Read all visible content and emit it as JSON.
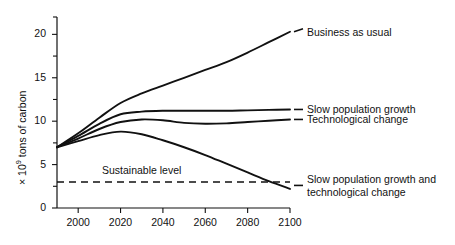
{
  "chart_data": {
    "type": "line",
    "title": "",
    "xlabel": "",
    "ylabel_prefix": "× 10",
    "ylabel_exponent": "9",
    "ylabel_suffix": " tons of carbon",
    "ylabel_full": "× 10⁹ tons of carbon",
    "xlim": [
      1990,
      2100
    ],
    "ylim": [
      0,
      22
    ],
    "grid": false,
    "legend_position": "right-inline-labels",
    "xticks": [
      2000,
      2020,
      2040,
      2060,
      2080,
      2100
    ],
    "xtick_labels": [
      "2000",
      "2020",
      "2040",
      "2060",
      "2080",
      "2100"
    ],
    "yticks": [
      0,
      5,
      10,
      15,
      20
    ],
    "ytick_labels": [
      "0",
      "5",
      "10",
      "15",
      "20"
    ],
    "yminor_ticks": [
      2.5,
      7.5,
      12.5,
      17.5,
      22
    ],
    "x": [
      1990,
      2000,
      2010,
      2020,
      2030,
      2040,
      2050,
      2060,
      2070,
      2080,
      2090,
      2100
    ],
    "series": [
      {
        "name": "Business as usual",
        "label": "Business as usual",
        "values": [
          7.0,
          8.6,
          10.4,
          12.1,
          13.2,
          14.1,
          15.0,
          15.9,
          16.8,
          17.9,
          19.1,
          20.3
        ],
        "label_x": 2103,
        "label_y": 20.3
      },
      {
        "name": "Slow population growth",
        "label": "Slow population growth",
        "values": [
          7.0,
          8.3,
          9.7,
          10.8,
          11.1,
          11.2,
          11.2,
          11.2,
          11.2,
          11.25,
          11.3,
          11.35
        ],
        "label_x": 2103,
        "label_y": 11.35
      },
      {
        "name": "Technological change",
        "label": "Technological change",
        "values": [
          7.0,
          8.0,
          9.1,
          9.9,
          10.2,
          10.1,
          9.8,
          9.7,
          9.75,
          9.9,
          10.05,
          10.2
        ],
        "label_x": 2103,
        "label_y": 10.2
      },
      {
        "name": "Slow population growth and technological change",
        "label_line1": "Slow population growth and",
        "label_line2": "technological change",
        "values": [
          7.0,
          7.7,
          8.4,
          8.8,
          8.5,
          7.8,
          7.0,
          6.1,
          5.1,
          4.1,
          3.1,
          2.2
        ],
        "label_x": 2103,
        "label_y": 2.6
      }
    ],
    "annotations": [
      {
        "name": "sustainable-level",
        "text": "Sustainable level",
        "type": "dashed-horizontal-line",
        "y_value": 3.0,
        "x_start": 1990,
        "x_end": 2100,
        "label_x": 2032,
        "label_y": 4.3
      }
    ]
  }
}
